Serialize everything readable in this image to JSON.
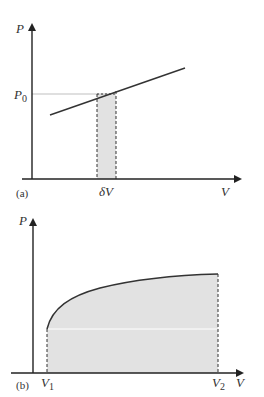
{
  "colors": {
    "axis": "#222222",
    "curve": "#333333",
    "fill": "#e2e2e2",
    "guide": "#bfbfbf",
    "dashed": "#333333"
  },
  "diagram_a": {
    "panel_label": "(a)",
    "y_axis_label": "P",
    "x_axis_label": "V",
    "p0_label_main": "P",
    "p0_label_sub": "0",
    "strip_label": "δV",
    "description": "Linear P–V line with thin strip of width δV at pressure P0 shaded"
  },
  "diagram_b": {
    "panel_label": "(b)",
    "y_axis_label": "P",
    "x_axis_label": "V",
    "v1_label_main": "V",
    "v1_label_sub": "1",
    "v2_label_main": "V",
    "v2_label_sub": "2",
    "description": "Concave rising P–V curve from V1 to V2 with area under the curve shaded"
  }
}
